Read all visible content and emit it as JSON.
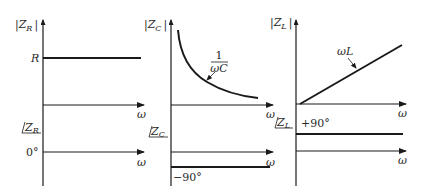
{
  "panels": {
    "resistor": {
      "mag_label": "|Z",
      "mag_sub": "R",
      "mag_close": "|",
      "level_label": "R",
      "omega_mag": "ω",
      "phase_label": "Z",
      "phase_sub": "R",
      "phase_value": "0°",
      "omega_phase": "ω"
    },
    "capacitor": {
      "mag_label": "|Z",
      "mag_sub": "C",
      "mag_close": "|",
      "curve_num": "1",
      "curve_den": "ωC",
      "omega_mag": "ω",
      "phase_label": "Z",
      "phase_sub": "C",
      "phase_value": "−90°",
      "omega_phase": "ω"
    },
    "inductor": {
      "mag_label": "|Z",
      "mag_sub": "L",
      "mag_close": "|",
      "line_label": "ωL",
      "omega_mag": "ω",
      "phase_label": "Z",
      "phase_sub": "L",
      "phase_value": "+90°",
      "omega_phase": "ω"
    }
  },
  "colors": {
    "ink": "#1a1a1a",
    "background": "#ffffff"
  }
}
